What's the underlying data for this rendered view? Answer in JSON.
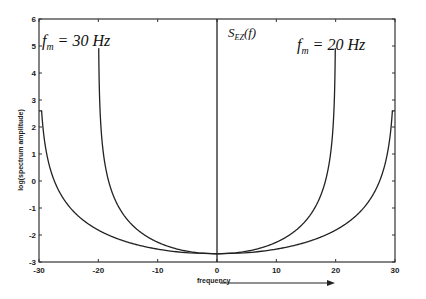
{
  "chart_data": {
    "type": "line",
    "title": "",
    "xlabel": "frequency",
    "ylabel": "log(spectrum amplitude)",
    "xlim": [
      -30,
      30
    ],
    "ylim": [
      -3,
      6
    ],
    "x_ticks": [
      -30,
      -20,
      -10,
      0,
      10,
      20,
      30
    ],
    "y_ticks": [
      -3,
      -2,
      -1,
      0,
      1,
      2,
      3,
      4,
      5,
      6
    ],
    "grid": false,
    "legend": null,
    "annotations": [
      {
        "text": "f",
        "sub": "m",
        "rest": " = 30 Hz",
        "x_px": 42,
        "y_px": 46,
        "size": 16
      },
      {
        "text": "f",
        "sub": "m",
        "rest": " = 20 Hz",
        "x_px": 297,
        "y_px": 50,
        "size": 16
      },
      {
        "text": "S",
        "sub": "EZ",
        "rest": "(f)",
        "x_px": 228,
        "y_px": 37,
        "size": 13
      }
    ],
    "series": [
      {
        "name": "fm = 30 Hz",
        "fm": 30,
        "clip_top": 2.6,
        "x": [
          -29.9,
          -29,
          -28,
          -25,
          -20,
          -15,
          -10,
          -5,
          0,
          5,
          10,
          15,
          20,
          25,
          28,
          29,
          29.9
        ],
        "values": [
          2.6,
          0.2,
          -0.9,
          -0.9,
          -1.8,
          -2.26,
          -2.52,
          -2.66,
          -2.7,
          -2.66,
          -2.52,
          -2.26,
          -1.8,
          -0.9,
          -0.9,
          0.2,
          2.6
        ]
      },
      {
        "name": "fm = 20 Hz",
        "fm": 20,
        "clip_top": 4.9,
        "x": [
          -20,
          -19.5,
          -19,
          -17,
          -15,
          -10,
          -5,
          0,
          5,
          10,
          15,
          17,
          19,
          19.5,
          20
        ],
        "values": [
          4.9,
          0.0,
          -0.5,
          -1.2,
          -1.46,
          -2.27,
          -2.6,
          -2.7,
          -2.6,
          -2.27,
          -1.46,
          -1.2,
          -0.5,
          0.0,
          4.9
        ]
      }
    ],
    "center_line": {
      "x": 0,
      "from": -3,
      "to": 6
    },
    "curve_model": "v = -2.7 - 1.5 * ln(1 - (f/fm)^2)",
    "arrow": {
      "label": "frequency direction",
      "x_from_px": 220,
      "x_to_px": 335,
      "y_px": 283
    }
  },
  "axis": {
    "xlabel": "frequency",
    "ylabel": "log(spectrum amplitude)"
  },
  "colors": {
    "line": "#222222",
    "axis": "#333333",
    "background": "#ffffff"
  }
}
